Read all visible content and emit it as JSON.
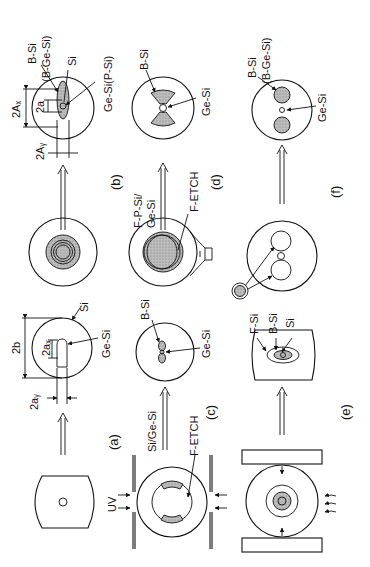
{
  "figure": {
    "orientation": "rotated 90 degrees counter-clockwise",
    "panels": {
      "a": {
        "label": "(a)",
        "dims": [
          "2b",
          "2aₓ",
          "2aᵧ"
        ],
        "labels": [
          "Si",
          "Ge-Si"
        ]
      },
      "b": {
        "label": "(b)",
        "dims": [
          "2Aₓ",
          "2Aᵧ",
          "2a"
        ],
        "labels": [
          "B-Si",
          "(B-Ge-Si)",
          "Si",
          "Ge-Si(P-Si)"
        ]
      },
      "c": {
        "label": "(c)",
        "labels": [
          "B-Si",
          "Ge-Si"
        ],
        "process": [
          "Si/Ge-Si",
          "F-ETCH",
          "UV"
        ]
      },
      "d": {
        "label": "(d)",
        "labels": [
          "B-Si",
          "Ge-Si"
        ],
        "process": [
          "F-P-Si/",
          "Ge-Si",
          "F-ETCH"
        ]
      },
      "e": {
        "label": "(e)",
        "labels": [
          "F-Si",
          "B-Si",
          "Si"
        ]
      },
      "f": {
        "label": "(f)",
        "labels": [
          "B-Si",
          "(B-Ge-Si)",
          "Ge-Si"
        ]
      }
    }
  }
}
